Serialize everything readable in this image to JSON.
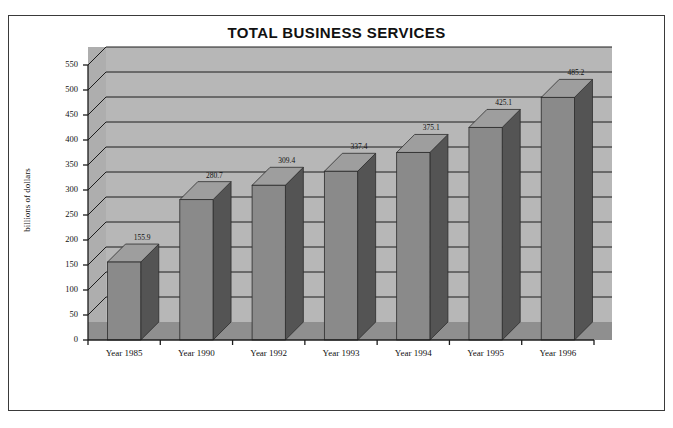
{
  "chart_data": {
    "type": "bar",
    "title": "TOTAL BUSINESS SERVICES",
    "xlabel": "",
    "ylabel": "billions of dollars",
    "categories": [
      "Year 1985",
      "Year 1990",
      "Year 1992",
      "Year 1993",
      "Year 1994",
      "Year 1995",
      "Year 1996"
    ],
    "values": [
      155.9,
      280.7,
      309.4,
      337.4,
      375.1,
      425.1,
      485.2
    ],
    "data_labels": [
      "155.9",
      "280.7",
      "309.4",
      "337.4",
      "375.1",
      "425.1",
      "485.2"
    ],
    "ylim": [
      0,
      550
    ],
    "yticks": [
      0,
      50,
      100,
      150,
      200,
      250,
      300,
      350,
      400,
      450,
      500,
      550
    ],
    "ytick_labels": [
      "0",
      "50",
      "100",
      "150",
      "200",
      "250",
      "300",
      "350",
      "400",
      "450",
      "500",
      "550"
    ],
    "grid": true,
    "legend": null,
    "style": "3d-column",
    "colors": {
      "bar_front": "#8a8a8a",
      "bar_side": "#545454",
      "bar_top": "#9e9e9e",
      "back_wall": "#b7b7b7",
      "left_wall": "#aeaeae",
      "floor": "#8f8f8f",
      "gridline": "#1c1c1c",
      "axis": "#1c1c1c",
      "frame": "#3a3a3a",
      "text": "#111111"
    }
  }
}
